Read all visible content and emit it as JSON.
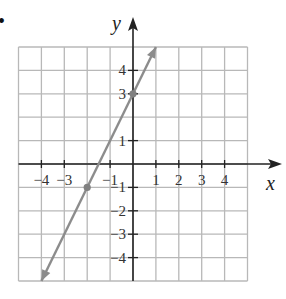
{
  "chart_data": {
    "type": "line",
    "title": "",
    "xlabel": "x",
    "ylabel": "y",
    "xlim": [
      -5,
      5
    ],
    "ylim": [
      -5,
      5
    ],
    "grid": true,
    "x_ticks": [
      -4,
      -3,
      -1,
      1,
      2,
      3,
      4
    ],
    "x_tick_labels": [
      "−4",
      "−3",
      "−1",
      "1",
      "2",
      "3",
      "4"
    ],
    "y_ticks": [
      4,
      3,
      1,
      -1,
      -2,
      -3,
      -4
    ],
    "y_tick_labels": [
      "4",
      "3",
      "1",
      "−1",
      "−2",
      "−3",
      "−4"
    ],
    "series": [
      {
        "name": "y = 2x + 3",
        "slope": 2,
        "intercept": 3,
        "x": [
          -4,
          1
        ],
        "y": [
          -5,
          5
        ],
        "arrows": "both",
        "color": "#8c8c8c"
      }
    ],
    "points": [
      {
        "x": 0,
        "y": 3
      },
      {
        "x": -2,
        "y": -1
      }
    ]
  },
  "bullet": "•",
  "colors": {
    "grid": "#b8b8b8",
    "axis": "#222222",
    "line": "#8c8c8c",
    "point": "#808080"
  }
}
